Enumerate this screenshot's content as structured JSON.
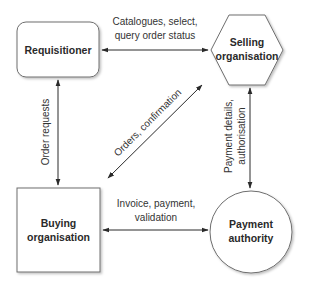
{
  "diagram": {
    "nodes": [
      {
        "id": "requisitioner",
        "shape": "rounded-rect",
        "lines": [
          "Requisitioner"
        ]
      },
      {
        "id": "selling",
        "shape": "hexagon",
        "lines": [
          "Selling",
          "organisation"
        ]
      },
      {
        "id": "buying",
        "shape": "rect",
        "lines": [
          "Buying",
          "organisation"
        ]
      },
      {
        "id": "payment",
        "shape": "circle",
        "lines": [
          "Payment",
          "authority"
        ]
      }
    ],
    "edges": [
      {
        "from": "requisitioner",
        "to": "selling",
        "direction": "both",
        "lines": [
          "Catalogues, select,",
          "query order status"
        ]
      },
      {
        "from": "requisitioner",
        "to": "buying",
        "direction": "both",
        "lines": [
          "Order requests"
        ]
      },
      {
        "from": "buying",
        "to": "selling",
        "direction": "both",
        "lines": [
          "Orders, confirmation"
        ]
      },
      {
        "from": "selling",
        "to": "payment",
        "direction": "both",
        "lines": [
          "Payment details,",
          "authorisation"
        ]
      },
      {
        "from": "buying",
        "to": "payment",
        "direction": "both",
        "lines": [
          "Invoice, payment,",
          "validation"
        ]
      }
    ]
  },
  "colors": {
    "stroke": "#6e6e6e",
    "arrow": "#2a2a2a",
    "text": "#2a2a2a"
  }
}
